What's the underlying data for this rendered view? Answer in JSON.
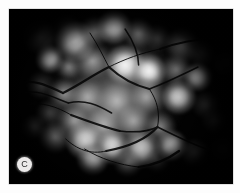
{
  "figure": {
    "panel_letter": "C",
    "modality_label": "fluorescein-angiogram",
    "background_color": "#ffffff",
    "plate_color": "#030303",
    "label_badge_color": "#eceaea",
    "label_text_color": "#2b2b2b"
  },
  "plate": {
    "left": 9,
    "top": 9,
    "width": 224,
    "height": 175
  },
  "lesions": [
    {
      "cx": 23,
      "cy": 28,
      "r": 11,
      "intensity": "soft"
    },
    {
      "cx": 43,
      "cy": 20,
      "r": 9,
      "intensity": "dim"
    },
    {
      "cx": 49,
      "cy": 32,
      "r": 13,
      "intensity": "bright"
    },
    {
      "cx": 63,
      "cy": 22,
      "r": 10,
      "intensity": "soft"
    },
    {
      "cx": 78,
      "cy": 18,
      "r": 11,
      "intensity": "bright"
    },
    {
      "cx": 96,
      "cy": 24,
      "r": 10,
      "intensity": "soft"
    },
    {
      "cx": 110,
      "cy": 29,
      "r": 9,
      "intensity": "dim"
    },
    {
      "cx": 128,
      "cy": 36,
      "r": 11,
      "intensity": "soft"
    },
    {
      "cx": 142,
      "cy": 44,
      "r": 9,
      "intensity": "dim"
    },
    {
      "cx": 30,
      "cy": 50,
      "r": 9,
      "intensity": "bright"
    },
    {
      "cx": 44,
      "cy": 58,
      "r": 8,
      "intensity": "soft"
    },
    {
      "cx": 62,
      "cy": 52,
      "r": 12,
      "intensity": "soft"
    },
    {
      "cx": 86,
      "cy": 56,
      "r": 13,
      "intensity": "bright"
    },
    {
      "cx": 104,
      "cy": 62,
      "r": 11,
      "intensity": "bright"
    },
    {
      "cx": 124,
      "cy": 60,
      "r": 10,
      "intensity": "soft"
    },
    {
      "cx": 140,
      "cy": 68,
      "r": 9,
      "intensity": "bright"
    },
    {
      "cx": 24,
      "cy": 76,
      "r": 9,
      "intensity": "dim"
    },
    {
      "cx": 40,
      "cy": 84,
      "r": 10,
      "intensity": "soft"
    },
    {
      "cx": 58,
      "cy": 88,
      "r": 12,
      "intensity": "soft"
    },
    {
      "cx": 80,
      "cy": 92,
      "r": 14,
      "intensity": "soft"
    },
    {
      "cx": 102,
      "cy": 88,
      "r": 12,
      "intensity": "soft"
    },
    {
      "cx": 126,
      "cy": 88,
      "r": 11,
      "intensity": "bright"
    },
    {
      "cx": 146,
      "cy": 96,
      "r": 9,
      "intensity": "dim"
    },
    {
      "cx": 30,
      "cy": 104,
      "r": 9,
      "intensity": "dim"
    },
    {
      "cx": 48,
      "cy": 112,
      "r": 11,
      "intensity": "soft"
    },
    {
      "cx": 70,
      "cy": 116,
      "r": 13,
      "intensity": "soft"
    },
    {
      "cx": 92,
      "cy": 112,
      "r": 12,
      "intensity": "soft"
    },
    {
      "cx": 112,
      "cy": 118,
      "r": 10,
      "intensity": "soft"
    },
    {
      "cx": 34,
      "cy": 128,
      "r": 10,
      "intensity": "soft"
    },
    {
      "cx": 56,
      "cy": 132,
      "r": 12,
      "intensity": "bright"
    },
    {
      "cx": 76,
      "cy": 138,
      "r": 11,
      "intensity": "bright"
    },
    {
      "cx": 98,
      "cy": 140,
      "r": 12,
      "intensity": "bright"
    },
    {
      "cx": 120,
      "cy": 136,
      "r": 10,
      "intensity": "bright"
    },
    {
      "cx": 138,
      "cy": 144,
      "r": 9,
      "intensity": "soft"
    },
    {
      "cx": 158,
      "cy": 140,
      "r": 8,
      "intensity": "dim"
    },
    {
      "cx": 62,
      "cy": 150,
      "r": 10,
      "intensity": "bright"
    },
    {
      "cx": 88,
      "cy": 154,
      "r": 9,
      "intensity": "soft"
    },
    {
      "cx": 110,
      "cy": 152,
      "r": 8,
      "intensity": "dim"
    },
    {
      "cx": 18,
      "cy": 118,
      "r": 8,
      "intensity": "dim"
    },
    {
      "cx": 160,
      "cy": 54,
      "r": 8,
      "intensity": "dim"
    },
    {
      "cx": 152,
      "cy": 112,
      "r": 8,
      "intensity": "dim"
    }
  ],
  "vessels": [
    "M 8 74 C 20 70, 30 78, 40 84",
    "M 10 84 C 22 80, 32 88, 44 94",
    "M 12 96 C 24 92, 36 98, 46 106",
    "M 40 84 C 52 76, 62 66, 74 58",
    "M 44 94 C 56 90, 66 96, 76 104",
    "M 74 58 C 86 50, 98 44, 112 40",
    "M 74 58 C 82 68, 92 76, 104 80",
    "M 104 80 C 116 74, 128 66, 140 58",
    "M 104 80 C 110 92, 112 104, 110 118",
    "M 110 118 C 102 130, 88 138, 72 142",
    "M 110 118 C 122 126, 134 134, 146 140",
    "M 72 142 C 60 146, 50 140, 42 130",
    "M 112 40 C 124 34, 138 30, 152 30",
    "M 86 20 C 92 32, 96 44, 96 56",
    "M 60 24 C 66 36, 70 48, 74 58",
    "M 46 106 C 58 112, 70 118, 82 122",
    "M 82 122 C 94 124, 104 122, 110 118",
    "M 56 140 C 68 150, 82 156, 96 158",
    "M 96 158 C 108 156, 118 150, 126 142"
  ]
}
